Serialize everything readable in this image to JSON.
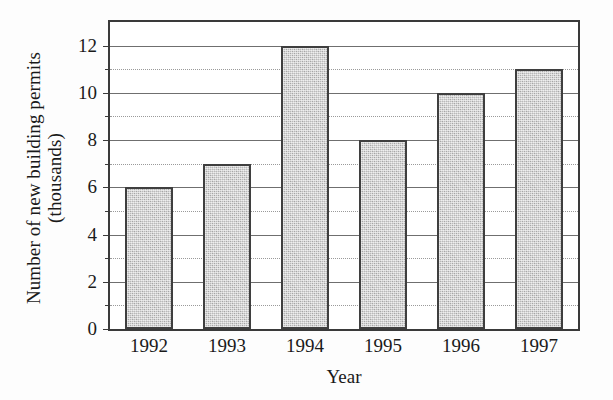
{
  "chart_data": {
    "type": "bar",
    "title": "",
    "xlabel": "Year",
    "ylabel_line1": "Number of new building permits",
    "ylabel_line2": "(thousands)",
    "categories": [
      "1992",
      "1993",
      "1994",
      "1995",
      "1996",
      "1997"
    ],
    "values": [
      6,
      7,
      12,
      8,
      10,
      11
    ],
    "ylim": [
      0,
      13
    ],
    "ytick_labels": [
      "0",
      "2",
      "4",
      "6",
      "8",
      "10",
      "12"
    ],
    "ytick_values": [
      0,
      2,
      4,
      6,
      8,
      10,
      12
    ],
    "minor_gridline_values": [
      1,
      3,
      5,
      7,
      9,
      11
    ],
    "grid": true,
    "legend": "none",
    "bar_fill_color": "#b9b9b9",
    "bar_edge_color": "#3f3f3f",
    "axis_color": "#3a3a3a",
    "gridline_color": "#6f6f6f",
    "minor_gridline_color": "#9a9a9a",
    "background_color": "#ffffff"
  }
}
